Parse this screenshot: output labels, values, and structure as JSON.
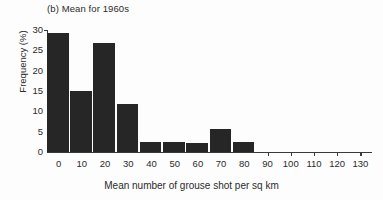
{
  "figure": {
    "panel_title": "(b) Mean for 1960s",
    "background_color": "#fdfdfd",
    "bar_color": "#262626",
    "axis_color": "#3a3a3a",
    "text_color": "#2b2b2b"
  },
  "chart_data": {
    "type": "bar",
    "title": "(b) Mean for 1960s",
    "subtitle": "",
    "xlabel": "Mean number of grouse shot per sq km",
    "ylabel": "Frequency (%)",
    "categories": [
      "0",
      "10",
      "20",
      "30",
      "40",
      "50",
      "60",
      "70",
      "80"
    ],
    "values": [
      29.3,
      15.1,
      26.8,
      11.9,
      2.4,
      2.4,
      2.3,
      5.6,
      2.4
    ],
    "xlim": [
      -5,
      135
    ],
    "ylim": [
      0,
      30
    ],
    "xticks": [
      0,
      10,
      20,
      30,
      40,
      50,
      60,
      70,
      80,
      90,
      100,
      110,
      120,
      130
    ],
    "xtick_labels": [
      "0",
      "10",
      "20",
      "30",
      "40",
      "50",
      "60",
      "70",
      "80",
      "90",
      "100",
      "110",
      "120",
      "130"
    ],
    "yticks": [
      0,
      5,
      10,
      15,
      20,
      25,
      30
    ],
    "ytick_labels": [
      "0",
      "5",
      "10",
      "15",
      "20",
      "25",
      "30"
    ],
    "grid": false,
    "legend": false,
    "bar_width": 10,
    "bar_align": "center",
    "note": "Histogram of frequency (%) versus mean number of grouse shot per sq km; bins of width 10 centred on the tick labels 0 through 80."
  }
}
